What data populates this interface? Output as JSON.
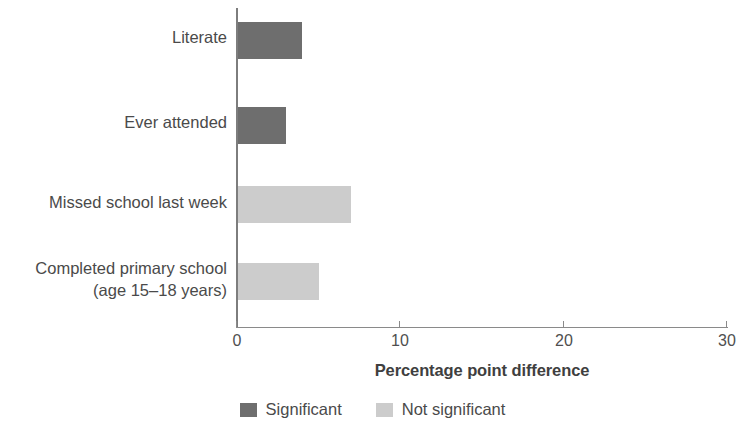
{
  "chart_data": {
    "type": "bar",
    "orientation": "horizontal",
    "title": "",
    "subtitle": "",
    "xlabel": "Percentage point difference",
    "ylabel": "",
    "xlim": [
      0,
      30
    ],
    "xticks": [
      "0",
      "10",
      "20",
      "30"
    ],
    "xtick_values": [
      0,
      10,
      20,
      30
    ],
    "grid": false,
    "legend_position": "bottom-center",
    "categories": [
      "Literate",
      "Ever attended",
      "Missed school last week",
      "Completed primary school\n(age 15–18 years)"
    ],
    "values": [
      4,
      3,
      7,
      5
    ],
    "point_significance": [
      "Significant",
      "Significant",
      "Not significant",
      "Not significant"
    ],
    "series": [
      {
        "name": "Percentage point difference",
        "values": [
          4,
          3,
          7,
          5
        ]
      }
    ],
    "bars": [
      {
        "label_line1": "Literate",
        "label_line2": "",
        "value": 4,
        "significance": "Significant",
        "color": "#6e6e6e"
      },
      {
        "label_line1": "Ever attended",
        "label_line2": "",
        "value": 3,
        "significance": "Significant",
        "color": "#6e6e6e"
      },
      {
        "label_line1": "Missed school last week",
        "label_line2": "",
        "value": 7,
        "significance": "Not significant",
        "color": "#cccccc"
      },
      {
        "label_line1": "Completed primary school",
        "label_line2": "(age 15–18 years)",
        "value": 5,
        "significance": "Not significant",
        "color": "#cccccc"
      }
    ],
    "legend": [
      {
        "label": "Significant",
        "color": "#6e6e6e"
      },
      {
        "label": "Not significant",
        "color": "#cccccc"
      }
    ]
  },
  "colors": {
    "significant": "#6e6e6e",
    "not_significant": "#cccccc",
    "axis": "#8a8a8a",
    "text": "#4a4a4a",
    "background": "#ffffff"
  }
}
